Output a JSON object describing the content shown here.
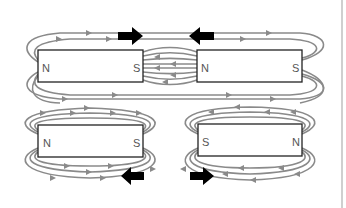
{
  "diagram": {
    "colors": {
      "field_line": "#8a8a8a",
      "magnet_border": "#222222",
      "magnet_fill": "#ffffff",
      "force_arrow": "#000000",
      "pole_label": "#555555"
    },
    "panels": [
      {
        "id": "top",
        "description": "Two magnets facing S to N (attract)",
        "magnets": [
          {
            "id": "top-left-magnet",
            "left_pole": "N",
            "right_pole": "S"
          },
          {
            "id": "top-right-magnet",
            "left_pole": "N",
            "right_pole": "S"
          }
        ],
        "force_arrows": [
          {
            "id": "top-arrow-right",
            "direction": "right"
          },
          {
            "id": "top-arrow-left",
            "direction": "left"
          }
        ]
      },
      {
        "id": "bottom",
        "description": "Two magnets facing S to S (repel)",
        "magnets": [
          {
            "id": "bottom-left-magnet",
            "left_pole": "N",
            "right_pole": "S"
          },
          {
            "id": "bottom-right-magnet",
            "left_pole": "S",
            "right_pole": "N"
          }
        ],
        "force_arrows": [
          {
            "id": "bottom-arrow-left",
            "direction": "left"
          },
          {
            "id": "bottom-arrow-right",
            "direction": "right"
          }
        ]
      }
    ]
  }
}
